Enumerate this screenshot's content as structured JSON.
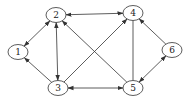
{
  "graph": {
    "type": "directed-graph",
    "nodes": [
      {
        "id": "1",
        "label": "1",
        "x": 18,
        "y": 52
      },
      {
        "id": "2",
        "label": "2",
        "x": 56,
        "y": 15
      },
      {
        "id": "3",
        "label": "3",
        "x": 58,
        "y": 88
      },
      {
        "id": "4",
        "label": "4",
        "x": 133,
        "y": 13
      },
      {
        "id": "5",
        "label": "5",
        "x": 133,
        "y": 88
      },
      {
        "id": "6",
        "label": "6",
        "x": 172,
        "y": 50
      }
    ],
    "edges": [
      {
        "from": "2",
        "to": "1",
        "arrow_end": true,
        "arrow_start": true
      },
      {
        "from": "3",
        "to": "1",
        "arrow_end": true,
        "arrow_start": false
      },
      {
        "from": "2",
        "to": "3",
        "arrow_end": true,
        "arrow_start": true
      },
      {
        "from": "2",
        "to": "4",
        "arrow_end": true,
        "arrow_start": true
      },
      {
        "from": "5",
        "to": "2",
        "arrow_end": true,
        "arrow_start": false
      },
      {
        "from": "3",
        "to": "4",
        "arrow_end": true,
        "arrow_start": false
      },
      {
        "from": "3",
        "to": "5",
        "arrow_end": true,
        "arrow_start": true
      },
      {
        "from": "4",
        "to": "5",
        "arrow_end": false,
        "arrow_start": false
      },
      {
        "from": "6",
        "to": "4",
        "arrow_end": true,
        "arrow_start": false
      },
      {
        "from": "5",
        "to": "6",
        "arrow_end": true,
        "arrow_start": true
      }
    ],
    "colors": {
      "stroke": "#333333",
      "background": "#ffffff"
    }
  }
}
